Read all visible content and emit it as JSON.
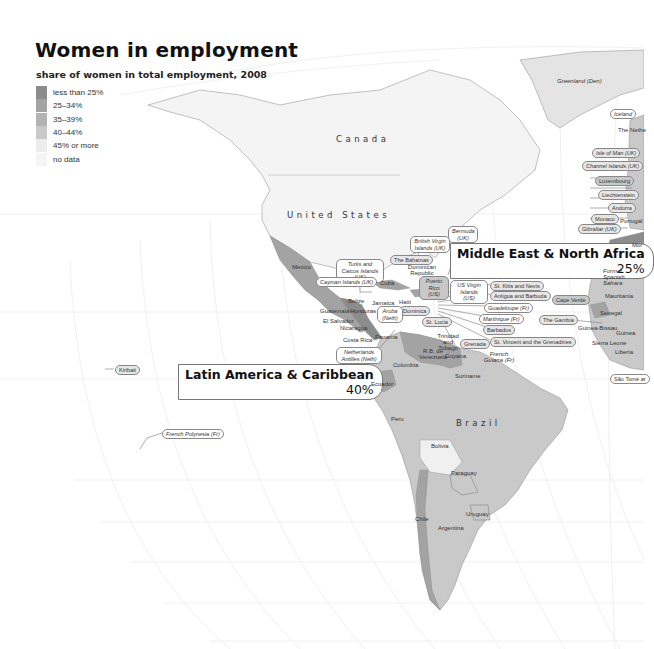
{
  "header": {
    "title": "Women in employment",
    "subtitle": "share of women in total employment, 2008"
  },
  "legend": {
    "items": [
      {
        "label": "less than 25%",
        "color": "#8c8c8c"
      },
      {
        "label": "25–34%",
        "color": "#a3a3a3"
      },
      {
        "label": "35–39%",
        "color": "#b3b3b3"
      },
      {
        "label": "40–44%",
        "color": "#c9c9c9"
      },
      {
        "label": "45% or more",
        "color": "#ececec"
      },
      {
        "label": "no data",
        "color": "#f4f4f4"
      }
    ]
  },
  "regions": {
    "latin_america": {
      "name": "Latin America & Caribbean",
      "value": "40%"
    },
    "mena": {
      "name": "Middle East & North Africa",
      "value": "25%"
    }
  },
  "countries": {
    "canada": "Canada",
    "usa": "United States",
    "brazil": "Brazil",
    "greenland": "Greenland (Den)",
    "iceland": "Iceland",
    "netherlands": "The Nethe",
    "isle_of_man": "Isle of Man (UK)",
    "channel_islands": "Channel Islands (UK)",
    "luxembourg": "Luxembourg",
    "liechtenstein": "Liechtenstein",
    "andorra": "Andorra",
    "monaco": "Monaco",
    "portugal": "Portugal",
    "gibraltar": "Gibraltar (UK)",
    "morocco": "Mor",
    "western_sahara": "Former Spanish Sahara",
    "mauritania": "Mauritania",
    "senegal": "Senegal",
    "cape_verde": "Cape Verde",
    "gambia": "The Gambia",
    "guinea_bissau": "Guinea-Bissau",
    "guinea": "Guinea",
    "sierra_leone": "Sierra Leone",
    "liberia": "Liberia",
    "cote_divoire": "C d'Iv",
    "sao_tome": "São Tomé ar",
    "mexico": "Mexico",
    "bermuda": "Bermuda (UK)",
    "bvi": "British Virgin Islands (UK)",
    "bahamas": "The Bahamas",
    "turks_caicos": "Turks and Caicos Islands (UK)",
    "dominican_republic": "Dominican Republic",
    "cayman": "Cayman Islands (UK)",
    "cuba": "Cuba",
    "puerto_rico": "Puerto Rico (US)",
    "usvi": "US Virgin Islands (US)",
    "st_kitts": "St. Kitts and Nevis",
    "antigua": "Antigua and Barbuda",
    "guadeloupe": "Guadeloupe (Fr)",
    "martinique": "Martinique (Fr)",
    "barbados": "Barbados",
    "st_vincent": "St. Vincent and the Grenadines",
    "dominica": "Dominica",
    "st_lucia": "St. Lucia",
    "grenada": "Grenada",
    "belize": "Belize",
    "jamaica": "Jamaica",
    "haiti": "Haiti",
    "guatemala": "Guatemala",
    "honduras": "Honduras",
    "el_salvador": "El Salvador",
    "nicaragua": "Nicaragua",
    "aruba": "Aruba (Neth)",
    "costa_rica": "Costa Rica",
    "panama": "Panama",
    "neth_antilles": "Netherlands Antilles (Neth)",
    "trinidad": "Trinidad and Tobago",
    "venezuela": "R.B. de Venezuela",
    "guyana": "Guyana",
    "suriname": "Suriname",
    "french_guiana": "French Guiana (Fr)",
    "colombia": "Colombia",
    "ecuador": "Ecuador",
    "peru": "Peru",
    "bolivia": "Bolivia",
    "paraguay": "Paraguay",
    "uruguay": "Uruguay",
    "chile": "Chile",
    "argentina": "Argentina",
    "kiribati": "Kiribati",
    "french_polynesia": "French Polynesia (Fr)"
  }
}
